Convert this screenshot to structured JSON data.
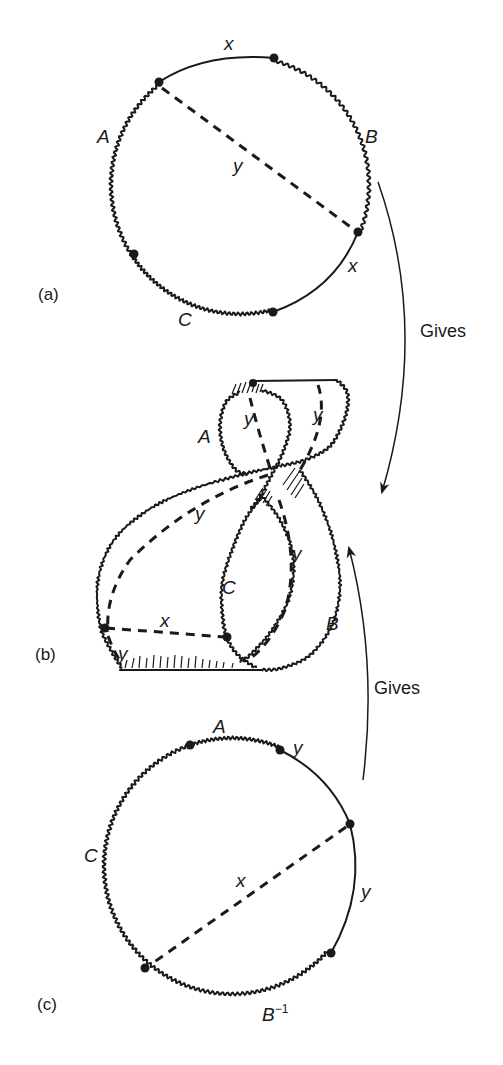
{
  "figure": {
    "panels": [
      {
        "id": "a",
        "label": "(a)",
        "shape": "circle",
        "edge_labels": {
          "top": "x",
          "left": "A",
          "right": "B",
          "chord": "y",
          "lower_right": "x",
          "bottom": "C"
        },
        "segments": [
          {
            "from": "upper-left dot",
            "to": "top-right dot",
            "style": "smooth",
            "label": "x"
          },
          {
            "from": "top-right dot",
            "to": "right dot",
            "style": "wavy",
            "label": "B"
          },
          {
            "from": "right dot",
            "to": "bottom dot",
            "style": "smooth",
            "label": "x"
          },
          {
            "from": "bottom dot",
            "to": "lower-left dot",
            "style": "wavy",
            "label": "C"
          },
          {
            "from": "lower-left dot",
            "to": "upper-left dot",
            "style": "wavy",
            "label": "A"
          }
        ],
        "chord": {
          "from": "upper-left dot",
          "to": "right dot",
          "style": "dashed",
          "label": "y"
        }
      },
      {
        "id": "b",
        "label": "(b)",
        "shape": "twisted strip",
        "edge_labels": {
          "upper_left": "A",
          "top_inner": "y",
          "top_right": "y",
          "middle": "y",
          "right_dashed": "y",
          "center": "C",
          "lower_right": "B",
          "bottom_dashed": "x",
          "bottom_left": "y"
        }
      },
      {
        "id": "c",
        "label": "(c)",
        "shape": "circle",
        "edge_labels": {
          "top": "A",
          "top_right": "y",
          "left": "C",
          "chord": "x",
          "right": "y",
          "bottom": "B",
          "bottom_sup": "−1"
        },
        "segments": [
          {
            "from": "top-left dot",
            "to": "top-right dot",
            "style": "wavy",
            "label": "A"
          },
          {
            "from": "top-right dot",
            "to": "right dot",
            "style": "smooth",
            "label": "y"
          },
          {
            "from": "right dot",
            "to": "lower-right dot",
            "style": "smooth",
            "label": "y"
          },
          {
            "from": "lower-right dot",
            "to": "lower-left dot",
            "style": "wavy",
            "label": "B−1"
          },
          {
            "from": "lower-left dot",
            "to": "top-left dot",
            "style": "wavy",
            "label": "C"
          }
        ],
        "chord": {
          "from": "right dot",
          "to": "lower-left dot",
          "style": "dashed",
          "label": "x"
        }
      }
    ],
    "arrows": [
      {
        "id": "gives-a-to-b",
        "label": "Gives",
        "direction": "down",
        "from": "a",
        "to": "b"
      },
      {
        "id": "gives-c-to-b",
        "label": "Gives",
        "direction": "up",
        "from": "c",
        "to": "b"
      }
    ],
    "colors": {
      "ink": "#1a1a1a",
      "background": "#ffffff"
    }
  }
}
